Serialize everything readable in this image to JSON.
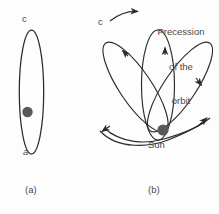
{
  "figure": {
    "background_color": "#fdfdfd",
    "stroke_color": "#2b2b2b",
    "text_color": "#4a4a4a",
    "sun_color": "#595959"
  },
  "panel_a": {
    "caption": "(a)",
    "apoapsis_label": "c",
    "periapsis_label": "a",
    "body_label": "",
    "sun_marker": "sun-dot"
  },
  "panel_b": {
    "caption": "(b)",
    "apoapsis_label": "c",
    "sun_label": "Sun",
    "annotation_line1": "Precession",
    "annotation_line2": "of the",
    "annotation_line3": "orbit",
    "arrow_icon": "precession-direction-arrow",
    "orbit_arrow_count": 5,
    "petal_count": 3
  }
}
